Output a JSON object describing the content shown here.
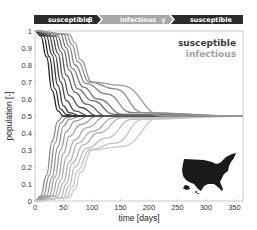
{
  "banner": {
    "segments": [
      {
        "label": "susceptible",
        "symbol": "β",
        "color": "#2a2a2a"
      },
      {
        "label": "infectious",
        "symbol": "γ",
        "color": "#a8a8a8"
      },
      {
        "label": "susceptible",
        "symbol": "",
        "color": "#2a2a2a"
      }
    ]
  },
  "legend": {
    "items": [
      {
        "label": "susceptible",
        "color": "#3a3a3a"
      },
      {
        "label": "infectious",
        "color": "#a0a0a0"
      }
    ]
  },
  "inset": {
    "icon": "usa-map-icon",
    "color": "#1a1a1a"
  },
  "chart_data": {
    "type": "line",
    "title": "",
    "xlabel": "time [days]",
    "ylabel": "population [-]",
    "xlim": [
      0,
      365
    ],
    "ylim": [
      0,
      1
    ],
    "xticks": [
      0,
      50,
      100,
      150,
      200,
      250,
      300,
      350
    ],
    "yticks": [
      0,
      0.1,
      0.2,
      0.3,
      0.4,
      0.5,
      0.6,
      0.7,
      0.8,
      0.9,
      1
    ],
    "grid": false,
    "legend_position": "upper right",
    "annotation": "curves converge to 0.5 by ~225 days",
    "series": [
      {
        "name": "susceptible",
        "color_range": [
          "#222222",
          "#9a9a9a"
        ],
        "count": 11,
        "description": "start at 1, drop to 0.5; onset delays from ~5 to ~65 days; later curves plateau around 0.65-0.7 before settling at 0.5 by ~225 days",
        "curves": [
          {
            "x": [
              0,
              10,
              20,
              30,
              40,
              50,
              60
            ],
            "y": [
              1,
              0.97,
              0.85,
              0.65,
              0.53,
              0.5,
              0.5
            ]
          },
          {
            "x": [
              0,
              15,
              25,
              35,
              45,
              55,
              70
            ],
            "y": [
              1,
              0.97,
              0.85,
              0.66,
              0.54,
              0.51,
              0.5
            ]
          },
          {
            "x": [
              0,
              20,
              30,
              40,
              50,
              60,
              80
            ],
            "y": [
              1,
              0.97,
              0.86,
              0.68,
              0.56,
              0.52,
              0.5
            ]
          },
          {
            "x": [
              0,
              25,
              35,
              45,
              55,
              70,
              95
            ],
            "y": [
              1,
              0.97,
              0.86,
              0.7,
              0.59,
              0.53,
              0.5
            ]
          },
          {
            "x": [
              0,
              30,
              40,
              50,
              60,
              80,
              110
            ],
            "y": [
              1,
              0.97,
              0.87,
              0.72,
              0.62,
              0.55,
              0.5
            ]
          },
          {
            "x": [
              0,
              35,
              45,
              55,
              70,
              90,
              125
            ],
            "y": [
              1,
              0.97,
              0.88,
              0.74,
              0.64,
              0.57,
              0.5
            ]
          },
          {
            "x": [
              0,
              40,
              50,
              60,
              75,
              100,
              140
            ],
            "y": [
              1,
              0.97,
              0.89,
              0.77,
              0.66,
              0.59,
              0.51
            ]
          },
          {
            "x": [
              0,
              45,
              55,
              65,
              85,
              110,
              155
            ],
            "y": [
              1,
              0.98,
              0.9,
              0.78,
              0.67,
              0.6,
              0.51
            ]
          },
          {
            "x": [
              0,
              50,
              60,
              70,
              90,
              125,
              170
            ],
            "y": [
              1,
              0.98,
              0.91,
              0.8,
              0.69,
              0.63,
              0.52
            ]
          },
          {
            "x": [
              0,
              55,
              65,
              75,
              95,
              140,
              190
            ],
            "y": [
              1,
              0.98,
              0.92,
              0.82,
              0.7,
              0.66,
              0.52
            ]
          },
          {
            "x": [
              0,
              60,
              70,
              80,
              100,
              150,
              225
            ],
            "y": [
              1,
              0.98,
              0.93,
              0.83,
              0.7,
              0.68,
              0.5
            ]
          }
        ]
      },
      {
        "name": "infectious",
        "color_range": [
          "#8a8a8a",
          "#c8c8c8"
        ],
        "count": 11,
        "description": "start at 0, rise to 0.5; onset delays from ~10 to ~65 days; later curves plateau around 0.3-0.33 before settling at 0.5 by ~225 days",
        "curves": [
          {
            "x": [
              0,
              10,
              20,
              30,
              40,
              50,
              60
            ],
            "y": [
              0,
              0.03,
              0.15,
              0.35,
              0.47,
              0.5,
              0.5
            ]
          },
          {
            "x": [
              0,
              15,
              25,
              35,
              45,
              55,
              70
            ],
            "y": [
              0,
              0.03,
              0.15,
              0.34,
              0.46,
              0.49,
              0.5
            ]
          },
          {
            "x": [
              0,
              20,
              30,
              40,
              50,
              60,
              80
            ],
            "y": [
              0,
              0.03,
              0.14,
              0.32,
              0.44,
              0.48,
              0.5
            ]
          },
          {
            "x": [
              0,
              25,
              35,
              45,
              55,
              70,
              95
            ],
            "y": [
              0,
              0.03,
              0.14,
              0.3,
              0.41,
              0.47,
              0.5
            ]
          },
          {
            "x": [
              0,
              30,
              40,
              50,
              60,
              80,
              110
            ],
            "y": [
              0,
              0.03,
              0.13,
              0.28,
              0.38,
              0.45,
              0.5
            ]
          },
          {
            "x": [
              0,
              35,
              45,
              55,
              70,
              90,
              125
            ],
            "y": [
              0,
              0.03,
              0.12,
              0.26,
              0.36,
              0.43,
              0.5
            ]
          },
          {
            "x": [
              0,
              40,
              50,
              60,
              75,
              100,
              140
            ],
            "y": [
              0,
              0.03,
              0.11,
              0.23,
              0.34,
              0.41,
              0.49
            ]
          },
          {
            "x": [
              0,
              45,
              55,
              65,
              85,
              110,
              155
            ],
            "y": [
              0,
              0.02,
              0.1,
              0.22,
              0.33,
              0.4,
              0.49
            ]
          },
          {
            "x": [
              0,
              50,
              60,
              70,
              90,
              125,
              170
            ],
            "y": [
              0,
              0.02,
              0.09,
              0.2,
              0.31,
              0.37,
              0.48
            ]
          },
          {
            "x": [
              0,
              55,
              65,
              75,
              95,
              140,
              190
            ],
            "y": [
              0,
              0.02,
              0.08,
              0.18,
              0.3,
              0.34,
              0.48
            ]
          },
          {
            "x": [
              0,
              60,
              70,
              80,
              100,
              150,
              225
            ],
            "y": [
              0,
              0.02,
              0.07,
              0.17,
              0.3,
              0.32,
              0.5
            ]
          }
        ]
      }
    ]
  }
}
